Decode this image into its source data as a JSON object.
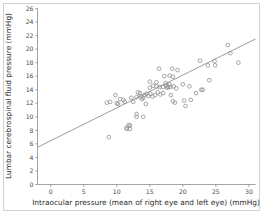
{
  "chart_data": {
    "type": "scatter",
    "title": "",
    "subtitle": "",
    "xlabel": "Intraocular pressure (mean of right eye and left eye) (mmHg)",
    "ylabel": "Lumbar cerebrospinal fluid pressure (mmHg)",
    "xlim": [
      -2,
      31
    ],
    "ylim": [
      0,
      26
    ],
    "xticks": [
      0,
      5,
      10,
      15,
      20,
      25,
      30
    ],
    "yticks": [
      0,
      2,
      4,
      6,
      8,
      10,
      12,
      14,
      16,
      18,
      20,
      22,
      24,
      26
    ],
    "xtick_labels": [
      "0",
      "5",
      "10",
      "15",
      "20",
      "25",
      "30"
    ],
    "ytick_labels": [
      "0",
      "2",
      "4",
      "6",
      "8",
      "10",
      "12",
      "14",
      "16",
      "18",
      "20",
      "22",
      "24",
      "26"
    ],
    "grid": false,
    "legend": null,
    "legend_position": "none",
    "marker_style": "open-circle",
    "marker_color": "#8a8a8a",
    "line_color": "#8a8a8a",
    "fit_line": {
      "type": "linear-regression",
      "x_start": -2,
      "y_start": 5.5,
      "x_end": 31,
      "y_end": 21.5,
      "slope": 0.485,
      "intercept": 6.47
    },
    "points": [
      [
        8.5,
        12.1
      ],
      [
        8.8,
        7.0
      ],
      [
        9.0,
        12.2
      ],
      [
        9.8,
        13.2
      ],
      [
        10.0,
        12.0
      ],
      [
        10.2,
        11.9
      ],
      [
        10.5,
        12.6
      ],
      [
        11.0,
        12.5
      ],
      [
        11.2,
        12.2
      ],
      [
        11.5,
        8.4
      ],
      [
        11.5,
        8.2
      ],
      [
        11.8,
        8.8
      ],
      [
        12.0,
        8.7
      ],
      [
        12.0,
        8.2
      ],
      [
        12.2,
        12.8
      ],
      [
        12.5,
        12.2
      ],
      [
        13.0,
        12.9
      ],
      [
        13.0,
        10.4
      ],
      [
        13.0,
        10.0
      ],
      [
        13.2,
        13.6
      ],
      [
        13.5,
        13.5
      ],
      [
        13.6,
        13.0
      ],
      [
        13.8,
        12.6
      ],
      [
        14.0,
        12.8
      ],
      [
        14.0,
        10.0
      ],
      [
        14.2,
        13.2
      ],
      [
        14.4,
        11.9
      ],
      [
        14.5,
        13.4
      ],
      [
        14.8,
        13.1
      ],
      [
        15.0,
        15.2
      ],
      [
        15.0,
        14.3
      ],
      [
        15.1,
        13.4
      ],
      [
        15.4,
        13.0
      ],
      [
        15.5,
        14.6
      ],
      [
        15.8,
        13.2
      ],
      [
        16.0,
        15.1
      ],
      [
        16.0,
        14.5
      ],
      [
        16.2,
        13.6
      ],
      [
        16.4,
        17.1
      ],
      [
        16.5,
        14.4
      ],
      [
        16.6,
        13.3
      ],
      [
        17.0,
        14.4
      ],
      [
        17.0,
        13.5
      ],
      [
        17.2,
        16.0
      ],
      [
        17.4,
        15.0
      ],
      [
        17.5,
        14.6
      ],
      [
        17.6,
        14.3
      ],
      [
        17.8,
        14.4
      ],
      [
        18.0,
        16.1
      ],
      [
        18.0,
        14.8
      ],
      [
        18.1,
        14.4
      ],
      [
        18.2,
        13.2
      ],
      [
        18.4,
        17.1
      ],
      [
        18.5,
        15.9
      ],
      [
        18.5,
        12.3
      ],
      [
        18.6,
        14.5
      ],
      [
        18.8,
        12.1
      ],
      [
        19.0,
        14.2
      ],
      [
        19.2,
        16.9
      ],
      [
        20.0,
        14.8
      ],
      [
        20.2,
        12.4
      ],
      [
        20.4,
        11.6
      ],
      [
        21.0,
        14.5
      ],
      [
        21.2,
        12.5
      ],
      [
        22.0,
        13.5
      ],
      [
        22.6,
        18.3
      ],
      [
        22.8,
        14.0
      ],
      [
        23.0,
        14.0
      ],
      [
        23.8,
        17.6
      ],
      [
        24.0,
        15.4
      ],
      [
        24.8,
        18.2
      ],
      [
        24.9,
        17.6
      ],
      [
        26.8,
        20.6
      ],
      [
        27.2,
        19.4
      ],
      [
        28.4,
        18.0
      ]
    ]
  },
  "figure": {
    "background_color": "#ffffff",
    "frame_color": "#c8c8c8"
  }
}
